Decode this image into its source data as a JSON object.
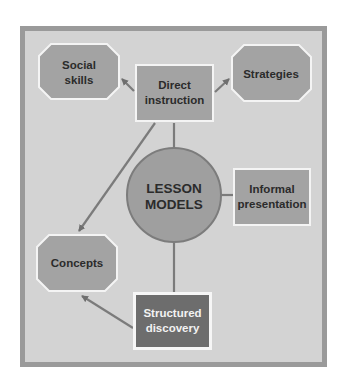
{
  "diagram": {
    "colors": {
      "frame_border": "#9a9a9a",
      "frame_fill": "#d3d3d3",
      "node_fill": "#a3a3a3",
      "node_dark_fill": "#6d6d6d",
      "node_outline": "#f4f4f4",
      "circle_fill": "#9f9f9f",
      "circle_stroke": "#7c7c7c",
      "connector": "#7b7b7b"
    },
    "center": {
      "line1": "LESSON",
      "line2": "MODELS",
      "shape": "circle"
    },
    "nodes": {
      "direct_instruction": {
        "line1": "Direct",
        "line2": "instruction",
        "shape": "rectangle"
      },
      "informal_presentation": {
        "line1": "Informal",
        "line2": "presentation",
        "shape": "rectangle"
      },
      "structured_discovery": {
        "line1": "Structured",
        "line2": "discovery",
        "shape": "rectangle",
        "emphasis": "dark"
      },
      "social_skills": {
        "line1": "Social",
        "line2": "skills",
        "shape": "octagon"
      },
      "strategies": {
        "line1": "Strategies",
        "shape": "octagon"
      },
      "concepts": {
        "line1": "Concepts",
        "shape": "octagon"
      }
    },
    "edges": [
      {
        "from": "LESSON MODELS",
        "to": "Direct instruction",
        "type": "line"
      },
      {
        "from": "LESSON MODELS",
        "to": "Informal presentation",
        "type": "line"
      },
      {
        "from": "LESSON MODELS",
        "to": "Structured discovery",
        "type": "line"
      },
      {
        "from": "Direct instruction",
        "to": "Social skills",
        "type": "arrow"
      },
      {
        "from": "Direct instruction",
        "to": "Strategies",
        "type": "arrow"
      },
      {
        "from": "Direct instruction",
        "to": "Concepts",
        "type": "arrow"
      },
      {
        "from": "Structured discovery",
        "to": "Concepts",
        "type": "arrow"
      }
    ]
  }
}
